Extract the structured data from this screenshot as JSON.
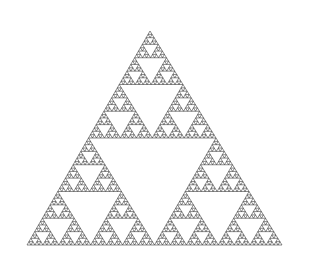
{
  "figure": {
    "background": "#ffffff",
    "stroke_color": "#2a2a2a",
    "vertices": {
      "apex": [
        150,
        31
      ],
      "left": [
        27,
        245
      ],
      "right": [
        282,
        245
      ]
    },
    "depth": 6
  }
}
